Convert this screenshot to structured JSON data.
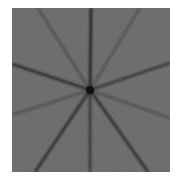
{
  "image": {
    "description": "Gray textured square with dark lines radiating from a central point (starburst / Siemens-star-like pattern)",
    "background_color": "#6b6b6b",
    "line_color": "#1e1e1e",
    "center": [
      78,
      82
    ],
    "rays": [
      {
        "to": [
          79,
          0
        ],
        "width": 2.6,
        "opacity": 0.95
      },
      {
        "to": [
          78,
          164
        ],
        "width": 2.2,
        "opacity": 0.8
      },
      {
        "to": [
          0,
          56
        ],
        "width": 2.4,
        "opacity": 0.85
      },
      {
        "to": [
          158,
          55
        ],
        "width": 2.2,
        "opacity": 0.8
      },
      {
        "to": [
          26,
          0
        ],
        "width": 2.0,
        "opacity": 0.45
      },
      {
        "to": [
          128,
          0
        ],
        "width": 2.0,
        "opacity": 0.4
      },
      {
        "to": [
          23,
          164
        ],
        "width": 2.4,
        "opacity": 0.85
      },
      {
        "to": [
          136,
          164
        ],
        "width": 2.4,
        "opacity": 0.85
      },
      {
        "to": [
          0,
          107
        ],
        "width": 2.0,
        "opacity": 0.4
      },
      {
        "to": [
          158,
          110
        ],
        "width": 2.0,
        "opacity": 0.4
      }
    ]
  }
}
